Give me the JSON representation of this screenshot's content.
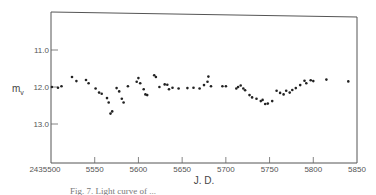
{
  "chart_data": {
    "type": "scatter",
    "title": "",
    "xlabel": "J. D.",
    "ylabel": "m_v",
    "ylabel_main": "m",
    "ylabel_sub": "v",
    "xlim": [
      5500,
      5850
    ],
    "ylim": [
      10.0,
      14.0
    ],
    "y_inverted": true,
    "grid": false,
    "x_ticks": [
      5500,
      5550,
      5600,
      5650,
      5700,
      5750,
      5800,
      5850
    ],
    "x_tick_labels": [
      "2435500",
      "5550",
      "5600",
      "5650",
      "5700",
      "5750",
      "5800",
      "5850"
    ],
    "y_ticks": [
      11.0,
      12.0,
      13.0
    ],
    "y_tick_labels": [
      "11.0",
      "12.0",
      "13.0"
    ],
    "series": [
      {
        "name": "visual magnitude",
        "points": [
          [
            5501,
            12.0
          ],
          [
            5508,
            12.02
          ],
          [
            5512,
            11.98
          ],
          [
            5524,
            11.73
          ],
          [
            5529,
            11.84
          ],
          [
            5540,
            11.81
          ],
          [
            5543,
            11.9
          ],
          [
            5551,
            12.04
          ],
          [
            5555,
            12.15
          ],
          [
            5558,
            12.18
          ],
          [
            5564,
            12.3
          ],
          [
            5566,
            12.42
          ],
          [
            5568,
            12.72
          ],
          [
            5570,
            12.66
          ],
          [
            5575,
            12.03
          ],
          [
            5578,
            12.12
          ],
          [
            5581,
            12.32
          ],
          [
            5583,
            12.42
          ],
          [
            5588,
            11.98
          ],
          [
            5598,
            11.86
          ],
          [
            5600,
            11.76
          ],
          [
            5602,
            11.9
          ],
          [
            5606,
            12.06
          ],
          [
            5608,
            12.2
          ],
          [
            5610,
            12.22
          ],
          [
            5618,
            11.68
          ],
          [
            5620,
            11.73
          ],
          [
            5624,
            12.0
          ],
          [
            5630,
            11.93
          ],
          [
            5633,
            11.94
          ],
          [
            5635,
            12.06
          ],
          [
            5639,
            12.02
          ],
          [
            5646,
            12.04
          ],
          [
            5656,
            12.03
          ],
          [
            5663,
            12.02
          ],
          [
            5670,
            12.04
          ],
          [
            5675,
            11.95
          ],
          [
            5679,
            11.86
          ],
          [
            5680,
            11.72
          ],
          [
            5683,
            11.98
          ],
          [
            5696,
            11.98
          ],
          [
            5700,
            11.98
          ],
          [
            5712,
            12.04
          ],
          [
            5714,
            12.0
          ],
          [
            5717,
            11.96
          ],
          [
            5720,
            12.04
          ],
          [
            5722,
            12.09
          ],
          [
            5727,
            12.22
          ],
          [
            5730,
            12.28
          ],
          [
            5735,
            12.32
          ],
          [
            5740,
            12.38
          ],
          [
            5742,
            12.35
          ],
          [
            5745,
            12.46
          ],
          [
            5748,
            12.45
          ],
          [
            5753,
            12.38
          ],
          [
            5758,
            12.1
          ],
          [
            5762,
            12.16
          ],
          [
            5766,
            12.2
          ],
          [
            5769,
            12.1
          ],
          [
            5773,
            12.15
          ],
          [
            5776,
            12.08
          ],
          [
            5780,
            12.03
          ],
          [
            5785,
            11.95
          ],
          [
            5790,
            11.83
          ],
          [
            5792,
            11.9
          ],
          [
            5797,
            11.82
          ],
          [
            5800,
            11.84
          ],
          [
            5815,
            11.8
          ],
          [
            5840,
            11.85
          ]
        ]
      }
    ],
    "caption": "Fig. 7. Light curve of ..."
  }
}
